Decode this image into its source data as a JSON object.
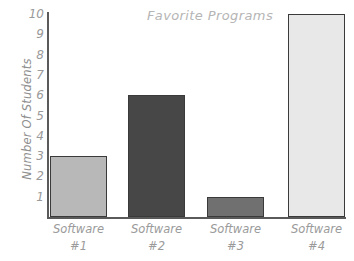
{
  "chart_data": {
    "type": "bar",
    "title": "Favorite Programs",
    "xlabel": "",
    "ylabel": "Number Of Students",
    "categories": [
      "Software #1",
      "Software #2",
      "Software #3",
      "Software #4"
    ],
    "category_lines": [
      {
        "line1": "Software",
        "line2": "#1"
      },
      {
        "line1": "Software",
        "line2": "#2"
      },
      {
        "line1": "Software",
        "line2": "#3"
      },
      {
        "line1": "Software",
        "line2": "#4"
      }
    ],
    "values": [
      3,
      6,
      1,
      10
    ],
    "ylim": [
      0,
      10
    ],
    "y_ticks": [
      10,
      9,
      8,
      7,
      6,
      5,
      4,
      3,
      2,
      1
    ],
    "grid": false,
    "legend": "none",
    "bar_colors": [
      "#b8b8b8",
      "#474747",
      "#707070",
      "#e8e8e8"
    ],
    "bar_outline_color": "#3a3a3a",
    "axis_color": "#5a5a5a",
    "text_color": "#9a9a9a",
    "title_color": "#b5b5b5",
    "background_color": "#ffffff"
  }
}
